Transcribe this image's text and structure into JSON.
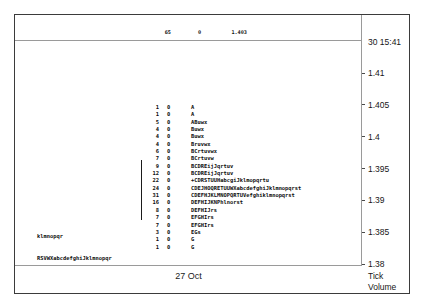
{
  "window": {
    "title": "Market Profile"
  },
  "header": {
    "rows": [
      {
        "count": "65",
        "zero": "0",
        "price": "1.403"
      },
      {
        "count": "72",
        "zero": "0",
        "price": "1.395"
      },
      {
        "count": "-6",
        "zero": "0",
        "price": "9.42"
      }
    ]
  },
  "price_axis": {
    "timestamp": "30 15:41",
    "ticks": [
      "1.41",
      "1.405",
      "1.4",
      "1.395",
      "1.39",
      "1.385",
      "1.38"
    ],
    "caption_line1": "Tick",
    "caption_line2": "Volume"
  },
  "x_axis": {
    "label": "27 Oct"
  },
  "side_labels": [
    "klmnopqr",
    "RSVWXabcdefghiJklmnopqr",
    "Habdfhijkmnpqr"
  ],
  "chart_data": {
    "type": "bar",
    "subtitle": "27 Oct",
    "xlabel": "Tick Volume",
    "ylabel": "Price",
    "ylim": [
      1.38,
      1.41
    ],
    "yticks": [
      1.41,
      1.405,
      1.4,
      1.395,
      1.39,
      1.385,
      1.38
    ],
    "grid": false,
    "legend": "none",
    "orientation": "horizontal",
    "categories": [
      "1.4075",
      "1.407",
      "1.4065",
      "1.406",
      "1.4055",
      "1.405",
      "1.4045",
      "1.404",
      "1.4035",
      "1.403",
      "1.4025",
      "1.402",
      "1.4015",
      "1.401",
      "1.4005",
      "1.4",
      "1.3995",
      "1.399",
      "1.3985",
      "1.398"
    ],
    "values": [
      1,
      1,
      5,
      4,
      4,
      4,
      6,
      7,
      9,
      12,
      22,
      24,
      31,
      16,
      8,
      7,
      7,
      3,
      1,
      1
    ],
    "series": [
      {
        "name": "Tick Volume (zero column)",
        "values": [
          0,
          0,
          0,
          0,
          0,
          0,
          0,
          0,
          0,
          0,
          0,
          0,
          0,
          0,
          0,
          0,
          0,
          0,
          0,
          0
        ]
      }
    ],
    "rows": [
      {
        "count": "1",
        "zero": "0",
        "letters": "A"
      },
      {
        "count": "1",
        "zero": "0",
        "letters": "A"
      },
      {
        "count": "5",
        "zero": "0",
        "letters": "ABuwx"
      },
      {
        "count": "4",
        "zero": "0",
        "letters": "Buwx"
      },
      {
        "count": "4",
        "zero": "0",
        "letters": "Buwx"
      },
      {
        "count": "4",
        "zero": "0",
        "letters": "Bruvwx"
      },
      {
        "count": "6",
        "zero": "0",
        "letters": "BCrtuvwx"
      },
      {
        "count": "7",
        "zero": "0",
        "letters": "BCrtuvw"
      },
      {
        "count": "9",
        "zero": "0",
        "letters": "BCDREijJqrtuv"
      },
      {
        "count": "12",
        "zero": "0",
        "letters": "BCDREijJqrtuv"
      },
      {
        "count": "22",
        "zero": "0",
        "letters": "+CDRSTUUHabcgiJklmopqrtu"
      },
      {
        "count": "24",
        "zero": "0",
        "letters": "CDEJHOQRETUUWXabcdefghiJklmnopqrst"
      },
      {
        "count": "31",
        "zero": "0",
        "letters": "CDEFHJKLMNOPQRTUVefghiklmnopqrst"
      },
      {
        "count": "16",
        "zero": "0",
        "letters": "DEFHIJKNPhlnorst"
      },
      {
        "count": "8",
        "zero": "0",
        "letters": "DEFHIJrs"
      },
      {
        "count": "7",
        "zero": "0",
        "letters": "EFGHIrs"
      },
      {
        "count": "7",
        "zero": "0",
        "letters": "EFGHIrs"
      },
      {
        "count": "3",
        "zero": "0",
        "letters": "EGs"
      },
      {
        "count": "1",
        "zero": "0",
        "letters": "G"
      },
      {
        "count": "1",
        "zero": "0",
        "letters": "G"
      }
    ]
  }
}
